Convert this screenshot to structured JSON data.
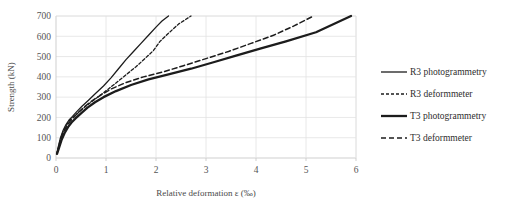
{
  "chart_data": {
    "type": "line",
    "title": "",
    "xlabel": "Relative deformation ε (‰)",
    "ylabel": "Strength (kN)",
    "xlim": [
      0,
      6
    ],
    "ylim": [
      0,
      700
    ],
    "xticks": [
      "0",
      "1",
      "2",
      "3",
      "4",
      "5",
      "6"
    ],
    "yticks": [
      "0",
      "100",
      "200",
      "300",
      "400",
      "500",
      "600",
      "700"
    ],
    "grid": true,
    "legend_position": "right",
    "series": [
      {
        "name": "R3 photogrammetry",
        "style": "solid-thin",
        "color": "#1c1c1c",
        "x": [
          0.02,
          0.05,
          0.09,
          0.14,
          0.2,
          0.27,
          0.33,
          0.42,
          0.52,
          0.65,
          0.8,
          0.95,
          1.1,
          1.25,
          1.4,
          1.55,
          1.7,
          1.85,
          2.0,
          2.12,
          2.25
        ],
        "y": [
          25,
          60,
          100,
          135,
          165,
          190,
          205,
          230,
          255,
          285,
          320,
          355,
          395,
          440,
          485,
          525,
          565,
          605,
          645,
          675,
          700
        ]
      },
      {
        "name": "R3 deformmeter",
        "style": "dotted",
        "color": "#1c1c1c",
        "x": [
          0.02,
          0.05,
          0.09,
          0.14,
          0.2,
          0.27,
          0.34,
          0.44,
          0.56,
          0.7,
          0.86,
          1.02,
          1.2,
          1.4,
          1.6,
          1.8,
          1.95,
          2.08,
          2.25,
          2.45,
          2.7
        ],
        "y": [
          22,
          55,
          95,
          128,
          158,
          185,
          200,
          222,
          248,
          275,
          305,
          335,
          370,
          410,
          450,
          495,
          530,
          575,
          615,
          660,
          700
        ]
      },
      {
        "name": "T3 photogrammetry",
        "style": "solid-thick",
        "color": "#1c1c1c",
        "x": [
          0.02,
          0.06,
          0.11,
          0.17,
          0.24,
          0.31,
          0.39,
          0.5,
          0.63,
          0.78,
          0.95,
          1.2,
          1.5,
          1.85,
          2.25,
          2.7,
          3.15,
          3.6,
          4.1,
          4.6,
          5.2,
          5.9
        ],
        "y": [
          20,
          50,
          88,
          122,
          152,
          175,
          195,
          220,
          248,
          275,
          300,
          330,
          360,
          388,
          412,
          440,
          472,
          505,
          540,
          575,
          620,
          700
        ]
      },
      {
        "name": "T3 deformmeter",
        "style": "dashed",
        "color": "#1c1c1c",
        "x": [
          0.02,
          0.06,
          0.1,
          0.16,
          0.22,
          0.29,
          0.36,
          0.46,
          0.58,
          0.72,
          0.88,
          1.1,
          1.4,
          1.75,
          2.15,
          2.55,
          3.0,
          3.45,
          3.9,
          4.35,
          4.75,
          5.15
        ],
        "y": [
          22,
          55,
          95,
          130,
          160,
          183,
          202,
          228,
          255,
          282,
          308,
          340,
          372,
          400,
          425,
          455,
          490,
          525,
          565,
          605,
          650,
          700
        ]
      }
    ]
  },
  "legend": {
    "entries": [
      {
        "label": "R3 photogrammetry",
        "style": "solid-thin"
      },
      {
        "label": "R3 deformmeter",
        "style": "dotted"
      },
      {
        "label": "T3 photogrammetry",
        "style": "solid-thick"
      },
      {
        "label": "T3 deformmeter",
        "style": "dashed"
      }
    ]
  }
}
